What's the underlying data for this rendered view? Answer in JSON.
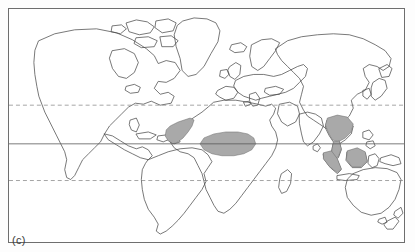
{
  "figure": {
    "panel_label": "(c)",
    "type": "distribution-map",
    "projection": "equirectangular",
    "frame_color": "#6e6e6e",
    "background_color": "#ffffff",
    "coastline_color": "#4a4a4a",
    "range_fill_color": "#a9a9a9",
    "range_outline_color": "#6a6a6a"
  },
  "gridlines": [
    {
      "name": "tropic-of-cancer",
      "style": "dashed",
      "y_px": 105,
      "color": "#7d7d7d"
    },
    {
      "name": "equator",
      "style": "solid",
      "y_px": 144,
      "color": "#5a5a5a"
    },
    {
      "name": "tropic-of-capricorn",
      "style": "dashed",
      "y_px": 181,
      "color": "#7d7d7d"
    }
  ],
  "shaded_regions": [
    {
      "name": "west-africa-range",
      "label": "West Africa"
    },
    {
      "name": "central-africa-range",
      "label": "Congo Basin"
    },
    {
      "name": "indochina-range",
      "label": "Indochina"
    },
    {
      "name": "malay-peninsula-range",
      "label": "Malay Peninsula"
    },
    {
      "name": "sumatra-range",
      "label": "Sumatra"
    },
    {
      "name": "borneo-range",
      "label": "Borneo"
    }
  ],
  "landmasses": [
    "North America",
    "South America",
    "Greenland",
    "Europe",
    "Africa",
    "Asia",
    "Australia",
    "New Zealand",
    "Japan",
    "Indonesia",
    "Madagascar",
    "British Isles",
    "Caribbean",
    "Philippines",
    "New Guinea",
    "Sri Lanka"
  ]
}
